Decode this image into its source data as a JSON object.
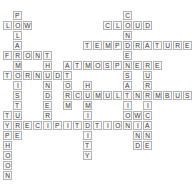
{
  "puzzle": {
    "title": "Weather Crossword Grid",
    "cell_size": 10,
    "origin_x": 3,
    "origin_y": 1,
    "grid_cols": 19,
    "grid_rows": 19,
    "colors": {
      "background": "#ffffff",
      "cell_fill": "#f7f7f7",
      "cell_border": "#b4b4b4",
      "letter": "#3a3a3a"
    },
    "entries": [
      {
        "answer": "POLAR",
        "direction": "down",
        "row": 1,
        "col": 1,
        "length": 5
      },
      {
        "answer": "LOW",
        "direction": "across",
        "row": 2,
        "col": 0,
        "length": 3
      },
      {
        "answer": "CLOUD",
        "direction": "across",
        "row": 2,
        "col": 10,
        "length": 5
      },
      {
        "answer": "CONDENSATION",
        "direction": "down",
        "row": 1,
        "col": 12,
        "length": 12
      },
      {
        "answer": "FRONT",
        "direction": "across",
        "row": 5,
        "col": 0,
        "length": 5
      },
      {
        "answer": "TEMPERATURE",
        "direction": "across",
        "row": 4,
        "col": 8,
        "length": 11
      },
      {
        "answer": "THUNDER",
        "direction": "down",
        "row": 5,
        "col": 4,
        "length": 7
      },
      {
        "answer": "ATMOSPHERE",
        "direction": "across",
        "row": 6,
        "col": 6,
        "length": 10
      },
      {
        "answer": "MOISTURE",
        "direction": "down",
        "row": 6,
        "col": 1,
        "length": 8
      },
      {
        "answer": "STORM",
        "direction": "down",
        "row": 6,
        "col": 6,
        "length": 5
      },
      {
        "answer": "HURRICANE",
        "direction": "down",
        "row": 6,
        "col": 14,
        "length": 9
      },
      {
        "answer": "TORNADO",
        "direction": "across",
        "row": 7,
        "col": 0,
        "length": 7
      },
      {
        "answer": "HUMIDITY",
        "direction": "down",
        "row": 8,
        "col": 8,
        "length": 8
      },
      {
        "answer": "CUMULONIMBUS",
        "direction": "across",
        "row": 9,
        "col": 7,
        "length": 12
      },
      {
        "answer": "WIND",
        "direction": "down",
        "row": 11,
        "col": 13,
        "length": 4
      },
      {
        "answer": "TYPHOON",
        "direction": "down",
        "row": 11,
        "col": 0,
        "length": 7
      },
      {
        "answer": "PRECIPITATION",
        "direction": "across",
        "row": 12,
        "col": 0,
        "length": 13
      }
    ]
  }
}
